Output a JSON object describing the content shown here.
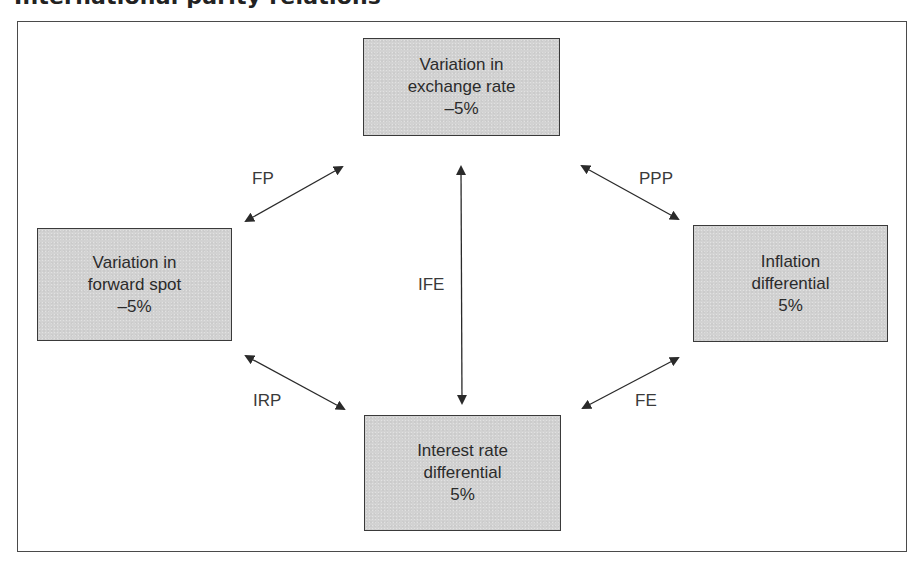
{
  "heading": "International parity relations",
  "nodes": {
    "exchange": {
      "line1": "Variation in",
      "line2": "exchange rate",
      "value": "–5%"
    },
    "forward": {
      "line1": "Variation in",
      "line2": "forward spot",
      "value": "–5%"
    },
    "inflation": {
      "line1": "Inflation",
      "line2": "differential",
      "value": "5%"
    },
    "interest": {
      "line1": "Interest rate",
      "line2": "differential",
      "value": "5%"
    }
  },
  "relations": {
    "fp": "FP",
    "ppp": "PPP",
    "ife": "IFE",
    "irp": "IRP",
    "fe": "FE"
  },
  "colors": {
    "box_fill": "#d2d2d2",
    "border": "#3a3a3a",
    "arrow": "#2a2a2a"
  }
}
